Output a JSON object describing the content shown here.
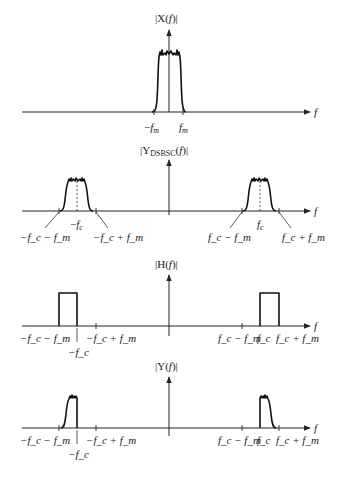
{
  "panels": [
    {
      "id": "x",
      "title": "|X(f)|",
      "axis_label": "f",
      "ticks": [
        {
          "label": "−f_m"
        },
        {
          "label": "f_m"
        }
      ]
    },
    {
      "id": "ydsbsc",
      "title_main": "|Y",
      "title_sub": "DSBSC",
      "title_tail": "(f)|",
      "axis_label": "f",
      "ticks": [
        {
          "label": "−f_c − f_m"
        },
        {
          "label": "−f_c"
        },
        {
          "label": "−f_c + f_m"
        },
        {
          "label": "f_c − f_m"
        },
        {
          "label": "f_c"
        },
        {
          "label": "f_c + f_m"
        }
      ]
    },
    {
      "id": "h",
      "title": "|H(f)|",
      "axis_label": "f",
      "ticks": [
        {
          "label": "−f_c − f_m"
        },
        {
          "label": "−f_c"
        },
        {
          "label": "−f_c + f_m"
        },
        {
          "label": "f_c − f_m"
        },
        {
          "label": "f_c"
        },
        {
          "label": "f_c + f_m"
        }
      ]
    },
    {
      "id": "y",
      "title": "|Y(f)|",
      "axis_label": "f",
      "ticks": [
        {
          "label": "−f_c − f_m"
        },
        {
          "label": "−f_c"
        },
        {
          "label": "−f_c + f_m"
        },
        {
          "label": "f_c − f_m"
        },
        {
          "label": "f_c"
        },
        {
          "label": "f_c + f_m"
        }
      ]
    }
  ],
  "text": {
    "x_title": "|X(",
    "f": "f",
    "close": ")|",
    "h_title": "|H(",
    "y_title": "|Y(",
    "ydsbsc_pre": "|Y",
    "ydsbsc_sub": "DSBSC",
    "ydsbsc_post": "(",
    "minus": "−",
    "plus": "+",
    "fm_f": "f",
    "fm_sub": "m",
    "fc_sub": "c"
  }
}
